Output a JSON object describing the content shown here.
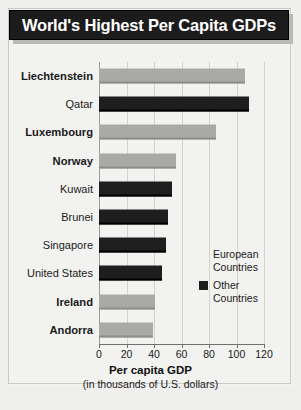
{
  "title": "World's Highest Per Capita GDPs",
  "legend": {
    "items": [
      {
        "label": "European\nCountries",
        "color": "#a9a9a6",
        "key": "european"
      },
      {
        "label": "Other\nCountries",
        "color": "#1e1e1e",
        "key": "other"
      }
    ]
  },
  "axis": {
    "title": "Per capita GDP",
    "subtitle": "(in thousands of U.S. dollars)",
    "ticks": [
      "0",
      "20",
      "40",
      "60",
      "80",
      "100",
      "120"
    ]
  },
  "chart_data": {
    "type": "bar",
    "orientation": "horizontal",
    "title": "World's Highest Per Capita GDPs",
    "xlabel": "Per capita GDP (in thousands of U.S. dollars)",
    "ylabel": "",
    "xlim": [
      0,
      120
    ],
    "xticks": [
      0,
      20,
      40,
      60,
      80,
      100,
      120
    ],
    "grid": true,
    "legend_position": "inside-right",
    "categories": [
      "Liechtenstein",
      "Qatar",
      "Luxembourg",
      "Norway",
      "Kuwait",
      "Brunei",
      "Singapore",
      "United States",
      "Ireland",
      "Andorra"
    ],
    "values": [
      106,
      109,
      85,
      56,
      53,
      50,
      49,
      46,
      41,
      39
    ],
    "groups": [
      "european",
      "other",
      "european",
      "european",
      "other",
      "other",
      "other",
      "other",
      "european",
      "european"
    ],
    "series": [
      {
        "name": "European Countries",
        "color": "#a9a9a6",
        "points": [
          {
            "category": "Liechtenstein",
            "value": 106
          },
          {
            "category": "Luxembourg",
            "value": 85
          },
          {
            "category": "Norway",
            "value": 56
          },
          {
            "category": "Ireland",
            "value": 41
          },
          {
            "category": "Andorra",
            "value": 39
          }
        ]
      },
      {
        "name": "Other Countries",
        "color": "#1e1e1e",
        "points": [
          {
            "category": "Qatar",
            "value": 109
          },
          {
            "category": "Kuwait",
            "value": 53
          },
          {
            "category": "Brunei",
            "value": 50
          },
          {
            "category": "Singapore",
            "value": 49
          },
          {
            "category": "United States",
            "value": 46
          }
        ]
      }
    ]
  }
}
